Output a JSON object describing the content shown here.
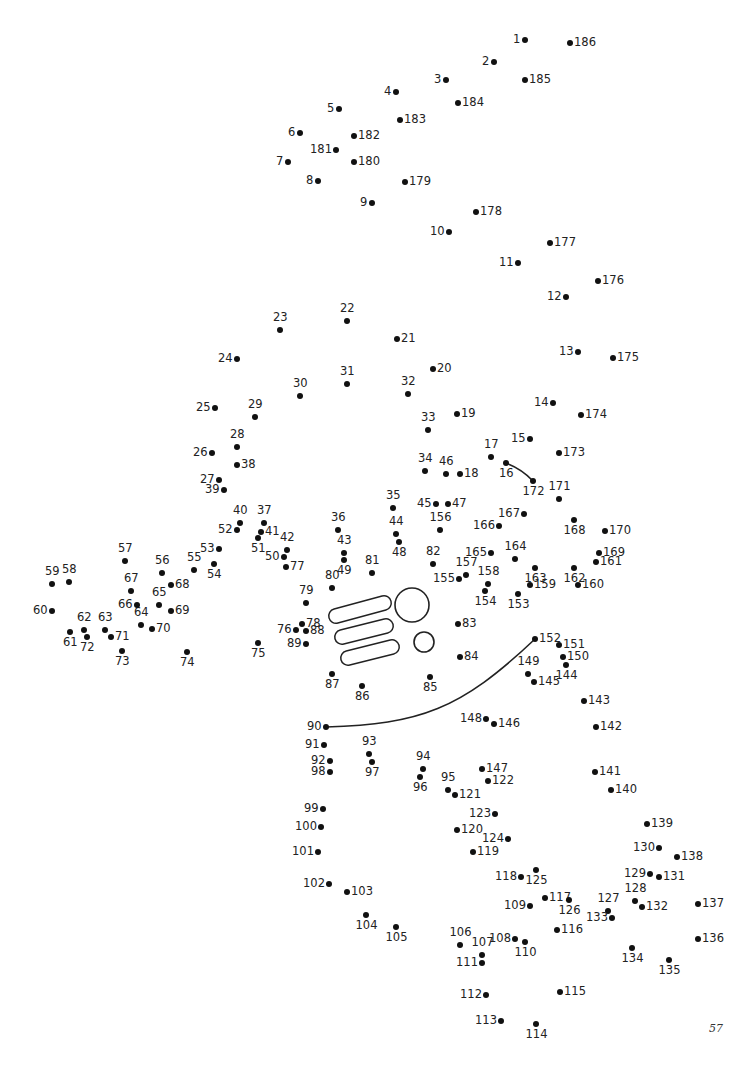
{
  "page": {
    "page_number": "57"
  },
  "dots": [
    {
      "n": "1",
      "x": 525,
      "y": 40,
      "lp": "l"
    },
    {
      "n": "2",
      "x": 494,
      "y": 62,
      "lp": "l"
    },
    {
      "n": "3",
      "x": 446,
      "y": 80,
      "lp": "l"
    },
    {
      "n": "4",
      "x": 396,
      "y": 92,
      "lp": "l"
    },
    {
      "n": "5",
      "x": 339,
      "y": 109,
      "lp": "l"
    },
    {
      "n": "6",
      "x": 300,
      "y": 133,
      "lp": "l"
    },
    {
      "n": "7",
      "x": 288,
      "y": 162,
      "lp": "l"
    },
    {
      "n": "8",
      "x": 318,
      "y": 181,
      "lp": "l"
    },
    {
      "n": "9",
      "x": 372,
      "y": 203,
      "lp": "l"
    },
    {
      "n": "10",
      "x": 449,
      "y": 232,
      "lp": "l"
    },
    {
      "n": "11",
      "x": 518,
      "y": 263,
      "lp": "l"
    },
    {
      "n": "12",
      "x": 566,
      "y": 297,
      "lp": "l"
    },
    {
      "n": "13",
      "x": 578,
      "y": 352,
      "lp": "l"
    },
    {
      "n": "14",
      "x": 553,
      "y": 403,
      "lp": "l"
    },
    {
      "n": "15",
      "x": 530,
      "y": 439,
      "lp": "l"
    },
    {
      "n": "16",
      "x": 506,
      "y": 463,
      "lp": "b"
    },
    {
      "n": "17",
      "x": 491,
      "y": 457,
      "lp": "t"
    },
    {
      "n": "18",
      "x": 460,
      "y": 474,
      "lp": "r"
    },
    {
      "n": "19",
      "x": 457,
      "y": 414,
      "lp": "r"
    },
    {
      "n": "20",
      "x": 433,
      "y": 369,
      "lp": "r"
    },
    {
      "n": "21",
      "x": 397,
      "y": 339,
      "lp": "r"
    },
    {
      "n": "22",
      "x": 347,
      "y": 321,
      "lp": "t"
    },
    {
      "n": "23",
      "x": 280,
      "y": 330,
      "lp": "t"
    },
    {
      "n": "24",
      "x": 237,
      "y": 359,
      "lp": "l"
    },
    {
      "n": "25",
      "x": 215,
      "y": 408,
      "lp": "l"
    },
    {
      "n": "26",
      "x": 212,
      "y": 453,
      "lp": "l"
    },
    {
      "n": "27",
      "x": 219,
      "y": 480,
      "lp": "l"
    },
    {
      "n": "28",
      "x": 237,
      "y": 447,
      "lp": "t"
    },
    {
      "n": "29",
      "x": 255,
      "y": 417,
      "lp": "t"
    },
    {
      "n": "30",
      "x": 300,
      "y": 396,
      "lp": "t"
    },
    {
      "n": "31",
      "x": 347,
      "y": 384,
      "lp": "t"
    },
    {
      "n": "32",
      "x": 408,
      "y": 394,
      "lp": "t"
    },
    {
      "n": "33",
      "x": 428,
      "y": 430,
      "lp": "t"
    },
    {
      "n": "34",
      "x": 425,
      "y": 471,
      "lp": "t"
    },
    {
      "n": "35",
      "x": 393,
      "y": 508,
      "lp": "t"
    },
    {
      "n": "36",
      "x": 338,
      "y": 530,
      "lp": "t"
    },
    {
      "n": "37",
      "x": 264,
      "y": 523,
      "lp": "t"
    },
    {
      "n": "38",
      "x": 237,
      "y": 465,
      "lp": "r"
    },
    {
      "n": "39",
      "x": 224,
      "y": 490,
      "lp": "l"
    },
    {
      "n": "40",
      "x": 240,
      "y": 523,
      "lp": "t"
    },
    {
      "n": "41",
      "x": 261,
      "y": 532,
      "lp": "r"
    },
    {
      "n": "42",
      "x": 287,
      "y": 550,
      "lp": "t"
    },
    {
      "n": "43",
      "x": 344,
      "y": 553,
      "lp": "t"
    },
    {
      "n": "44",
      "x": 396,
      "y": 534,
      "lp": "t"
    },
    {
      "n": "45",
      "x": 436,
      "y": 504,
      "lp": "l"
    },
    {
      "n": "46",
      "x": 446,
      "y": 474,
      "lp": "t"
    },
    {
      "n": "47",
      "x": 448,
      "y": 504,
      "lp": "r"
    },
    {
      "n": "48",
      "x": 399,
      "y": 542,
      "lp": "b"
    },
    {
      "n": "49",
      "x": 344,
      "y": 560,
      "lp": "b"
    },
    {
      "n": "50",
      "x": 284,
      "y": 557,
      "lp": "l"
    },
    {
      "n": "51",
      "x": 258,
      "y": 538,
      "lp": "b"
    },
    {
      "n": "52",
      "x": 237,
      "y": 530,
      "lp": "l"
    },
    {
      "n": "53",
      "x": 219,
      "y": 549,
      "lp": "l"
    },
    {
      "n": "54",
      "x": 214,
      "y": 564,
      "lp": "b"
    },
    {
      "n": "55",
      "x": 194,
      "y": 570,
      "lp": "t"
    },
    {
      "n": "56",
      "x": 162,
      "y": 573,
      "lp": "t"
    },
    {
      "n": "57",
      "x": 125,
      "y": 561,
      "lp": "t"
    },
    {
      "n": "58",
      "x": 69,
      "y": 582,
      "lp": "t"
    },
    {
      "n": "59",
      "x": 52,
      "y": 584,
      "lp": "t"
    },
    {
      "n": "60",
      "x": 52,
      "y": 611,
      "lp": "l"
    },
    {
      "n": "61",
      "x": 70,
      "y": 632,
      "lp": "b"
    },
    {
      "n": "62",
      "x": 84,
      "y": 630,
      "lp": "t"
    },
    {
      "n": "63",
      "x": 105,
      "y": 630,
      "lp": "t"
    },
    {
      "n": "64",
      "x": 141,
      "y": 625,
      "lp": "t"
    },
    {
      "n": "65",
      "x": 159,
      "y": 605,
      "lp": "t"
    },
    {
      "n": "66",
      "x": 137,
      "y": 605,
      "lp": "l"
    },
    {
      "n": "67",
      "x": 131,
      "y": 591,
      "lp": "t"
    },
    {
      "n": "68",
      "x": 171,
      "y": 585,
      "lp": "r"
    },
    {
      "n": "69",
      "x": 171,
      "y": 611,
      "lp": "r"
    },
    {
      "n": "70",
      "x": 152,
      "y": 629,
      "lp": "r"
    },
    {
      "n": "71",
      "x": 111,
      "y": 637,
      "lp": "r"
    },
    {
      "n": "72",
      "x": 87,
      "y": 637,
      "lp": "b"
    },
    {
      "n": "73",
      "x": 122,
      "y": 651,
      "lp": "b"
    },
    {
      "n": "74",
      "x": 187,
      "y": 652,
      "lp": "b"
    },
    {
      "n": "75",
      "x": 258,
      "y": 643,
      "lp": "b"
    },
    {
      "n": "76",
      "x": 296,
      "y": 630,
      "lp": "l"
    },
    {
      "n": "77",
      "x": 286,
      "y": 567,
      "lp": "r"
    },
    {
      "n": "78",
      "x": 302,
      "y": 624,
      "lp": "r"
    },
    {
      "n": "79",
      "x": 306,
      "y": 603,
      "lp": "t"
    },
    {
      "n": "80",
      "x": 332,
      "y": 588,
      "lp": "t"
    },
    {
      "n": "81",
      "x": 372,
      "y": 573,
      "lp": "t"
    },
    {
      "n": "82",
      "x": 433,
      "y": 564,
      "lp": "t"
    },
    {
      "n": "83",
      "x": 458,
      "y": 624,
      "lp": "r"
    },
    {
      "n": "84",
      "x": 460,
      "y": 657,
      "lp": "r"
    },
    {
      "n": "85",
      "x": 430,
      "y": 677,
      "lp": "b"
    },
    {
      "n": "86",
      "x": 362,
      "y": 686,
      "lp": "b"
    },
    {
      "n": "87",
      "x": 332,
      "y": 674,
      "lp": "b"
    },
    {
      "n": "88",
      "x": 306,
      "y": 631,
      "lp": "r"
    },
    {
      "n": "89",
      "x": 306,
      "y": 644,
      "lp": "l"
    },
    {
      "n": "90",
      "x": 326,
      "y": 727,
      "lp": "l"
    },
    {
      "n": "91",
      "x": 324,
      "y": 745,
      "lp": "l"
    },
    {
      "n": "92",
      "x": 330,
      "y": 761,
      "lp": "l"
    },
    {
      "n": "93",
      "x": 369,
      "y": 754,
      "lp": "t"
    },
    {
      "n": "94",
      "x": 423,
      "y": 769,
      "lp": "t"
    },
    {
      "n": "95",
      "x": 448,
      "y": 790,
      "lp": "t"
    },
    {
      "n": "96",
      "x": 420,
      "y": 777,
      "lp": "b"
    },
    {
      "n": "97",
      "x": 372,
      "y": 762,
      "lp": "b"
    },
    {
      "n": "98",
      "x": 330,
      "y": 772,
      "lp": "l"
    },
    {
      "n": "99",
      "x": 323,
      "y": 809,
      "lp": "l"
    },
    {
      "n": "100",
      "x": 321,
      "y": 827,
      "lp": "l"
    },
    {
      "n": "101",
      "x": 318,
      "y": 852,
      "lp": "l"
    },
    {
      "n": "102",
      "x": 329,
      "y": 884,
      "lp": "l"
    },
    {
      "n": "103",
      "x": 347,
      "y": 892,
      "lp": "r"
    },
    {
      "n": "104",
      "x": 366,
      "y": 915,
      "lp": "b"
    },
    {
      "n": "105",
      "x": 396,
      "y": 927,
      "lp": "b"
    },
    {
      "n": "106",
      "x": 460,
      "y": 945,
      "lp": "t"
    },
    {
      "n": "107",
      "x": 482,
      "y": 955,
      "lp": "t"
    },
    {
      "n": "108",
      "x": 515,
      "y": 939,
      "lp": "l"
    },
    {
      "n": "109",
      "x": 530,
      "y": 906,
      "lp": "l"
    },
    {
      "n": "110",
      "x": 525,
      "y": 942,
      "lp": "b"
    },
    {
      "n": "111",
      "x": 482,
      "y": 963,
      "lp": "l"
    },
    {
      "n": "112",
      "x": 486,
      "y": 995,
      "lp": "l"
    },
    {
      "n": "113",
      "x": 501,
      "y": 1021,
      "lp": "l"
    },
    {
      "n": "114",
      "x": 536,
      "y": 1024,
      "lp": "b"
    },
    {
      "n": "115",
      "x": 560,
      "y": 992,
      "lp": "r"
    },
    {
      "n": "116",
      "x": 557,
      "y": 930,
      "lp": "r"
    },
    {
      "n": "117",
      "x": 545,
      "y": 898,
      "lp": "r"
    },
    {
      "n": "118",
      "x": 521,
      "y": 877,
      "lp": "l"
    },
    {
      "n": "119",
      "x": 473,
      "y": 852,
      "lp": "r"
    },
    {
      "n": "120",
      "x": 457,
      "y": 830,
      "lp": "r"
    },
    {
      "n": "121",
      "x": 455,
      "y": 795,
      "lp": "r"
    },
    {
      "n": "122",
      "x": 488,
      "y": 781,
      "lp": "r"
    },
    {
      "n": "123",
      "x": 495,
      "y": 814,
      "lp": "l"
    },
    {
      "n": "124",
      "x": 508,
      "y": 839,
      "lp": "l"
    },
    {
      "n": "125",
      "x": 536,
      "y": 870,
      "lp": "b"
    },
    {
      "n": "126",
      "x": 569,
      "y": 900,
      "lp": "b"
    },
    {
      "n": "127",
      "x": 608,
      "y": 911,
      "lp": "t"
    },
    {
      "n": "128",
      "x": 635,
      "y": 901,
      "lp": "t"
    },
    {
      "n": "129",
      "x": 650,
      "y": 874,
      "lp": "l"
    },
    {
      "n": "130",
      "x": 659,
      "y": 848,
      "lp": "l"
    },
    {
      "n": "131",
      "x": 659,
      "y": 877,
      "lp": "r"
    },
    {
      "n": "132",
      "x": 642,
      "y": 907,
      "lp": "r"
    },
    {
      "n": "133",
      "x": 612,
      "y": 918,
      "lp": "l"
    },
    {
      "n": "134",
      "x": 632,
      "y": 948,
      "lp": "b"
    },
    {
      "n": "135",
      "x": 669,
      "y": 960,
      "lp": "b"
    },
    {
      "n": "136",
      "x": 698,
      "y": 939,
      "lp": "r"
    },
    {
      "n": "137",
      "x": 698,
      "y": 904,
      "lp": "r"
    },
    {
      "n": "138",
      "x": 677,
      "y": 857,
      "lp": "r"
    },
    {
      "n": "139",
      "x": 647,
      "y": 824,
      "lp": "r"
    },
    {
      "n": "140",
      "x": 611,
      "y": 790,
      "lp": "r"
    },
    {
      "n": "141",
      "x": 595,
      "y": 772,
      "lp": "r"
    },
    {
      "n": "142",
      "x": 596,
      "y": 727,
      "lp": "r"
    },
    {
      "n": "143",
      "x": 584,
      "y": 701,
      "lp": "r"
    },
    {
      "n": "144",
      "x": 566,
      "y": 665,
      "lp": "b"
    },
    {
      "n": "145",
      "x": 534,
      "y": 682,
      "lp": "r"
    },
    {
      "n": "146",
      "x": 494,
      "y": 724,
      "lp": "r"
    },
    {
      "n": "147",
      "x": 482,
      "y": 769,
      "lp": "r"
    },
    {
      "n": "148",
      "x": 486,
      "y": 719,
      "lp": "l"
    },
    {
      "n": "149",
      "x": 528,
      "y": 674,
      "lp": "t"
    },
    {
      "n": "150",
      "x": 563,
      "y": 657,
      "lp": "r"
    },
    {
      "n": "151",
      "x": 559,
      "y": 645,
      "lp": "r"
    },
    {
      "n": "152",
      "x": 535,
      "y": 639,
      "lp": "r"
    },
    {
      "n": "153",
      "x": 518,
      "y": 594,
      "lp": "b"
    },
    {
      "n": "154",
      "x": 485,
      "y": 591,
      "lp": "b"
    },
    {
      "n": "155",
      "x": 459,
      "y": 579,
      "lp": "l"
    },
    {
      "n": "156",
      "x": 440,
      "y": 530,
      "lp": "t"
    },
    {
      "n": "157",
      "x": 466,
      "y": 575,
      "lp": "t"
    },
    {
      "n": "158",
      "x": 488,
      "y": 584,
      "lp": "t"
    },
    {
      "n": "159",
      "x": 530,
      "y": 585,
      "lp": "r"
    },
    {
      "n": "160",
      "x": 578,
      "y": 585,
      "lp": "r"
    },
    {
      "n": "161",
      "x": 596,
      "y": 562,
      "lp": "r"
    },
    {
      "n": "162",
      "x": 574,
      "y": 568,
      "lp": "b"
    },
    {
      "n": "163",
      "x": 535,
      "y": 568,
      "lp": "b"
    },
    {
      "n": "164",
      "x": 515,
      "y": 559,
      "lp": "t"
    },
    {
      "n": "165",
      "x": 491,
      "y": 553,
      "lp": "l"
    },
    {
      "n": "166",
      "x": 499,
      "y": 526,
      "lp": "l"
    },
    {
      "n": "167",
      "x": 524,
      "y": 514,
      "lp": "l"
    },
    {
      "n": "168",
      "x": 574,
      "y": 520,
      "lp": "b"
    },
    {
      "n": "169",
      "x": 599,
      "y": 553,
      "lp": "r"
    },
    {
      "n": "170",
      "x": 605,
      "y": 531,
      "lp": "r"
    },
    {
      "n": "171",
      "x": 559,
      "y": 499,
      "lp": "t"
    },
    {
      "n": "172",
      "x": 533,
      "y": 481,
      "lp": "b"
    },
    {
      "n": "173",
      "x": 559,
      "y": 453,
      "lp": "r"
    },
    {
      "n": "174",
      "x": 581,
      "y": 415,
      "lp": "r"
    },
    {
      "n": "175",
      "x": 613,
      "y": 358,
      "lp": "r"
    },
    {
      "n": "176",
      "x": 598,
      "y": 281,
      "lp": "r"
    },
    {
      "n": "177",
      "x": 550,
      "y": 243,
      "lp": "r"
    },
    {
      "n": "178",
      "x": 476,
      "y": 212,
      "lp": "r"
    },
    {
      "n": "179",
      "x": 405,
      "y": 182,
      "lp": "r"
    },
    {
      "n": "180",
      "x": 354,
      "y": 162,
      "lp": "r"
    },
    {
      "n": "181",
      "x": 336,
      "y": 150,
      "lp": "l"
    },
    {
      "n": "182",
      "x": 354,
      "y": 136,
      "lp": "r"
    },
    {
      "n": "183",
      "x": 400,
      "y": 120,
      "lp": "r"
    },
    {
      "n": "184",
      "x": 458,
      "y": 103,
      "lp": "r"
    },
    {
      "n": "185",
      "x": 525,
      "y": 80,
      "lp": "r"
    },
    {
      "n": "186",
      "x": 570,
      "y": 43,
      "lp": "r"
    }
  ],
  "shapes": {
    "curve_16_172": "M506,463 Q522,469 533,481",
    "curve_90_152": "M326,727 C420,724 460,710 535,639",
    "pills": [
      {
        "x1": 336,
        "y1": 616,
        "x2": 384,
        "y2": 603
      },
      {
        "x1": 342,
        "y1": 637,
        "x2": 386,
        "y2": 626
      },
      {
        "x1": 348,
        "y1": 658,
        "x2": 392,
        "y2": 647
      }
    ],
    "circles": [
      {
        "cx": 412,
        "cy": 605,
        "r": 17
      },
      {
        "cx": 424,
        "cy": 642,
        "r": 10
      }
    ]
  }
}
